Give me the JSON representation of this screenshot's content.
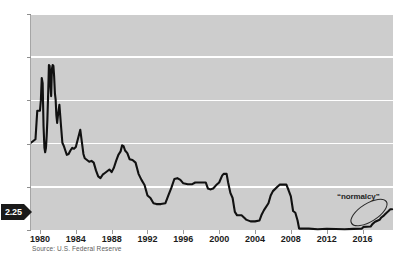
{
  "chart_data": {
    "type": "line",
    "title": "",
    "subtitle": "",
    "xlabel": "",
    "ylabel": "",
    "xlim": [
      1979.0,
      2019.4
    ],
    "ylim": [
      0,
      25
    ],
    "grid": true,
    "grid_axis": "y",
    "legend": "none",
    "series_name": "Federal funds rate",
    "series_color": "#111111",
    "plot_background": "#cdcdcd",
    "gridline_color": "#ffffff",
    "x_ticks": [
      1980,
      1984,
      1988,
      1992,
      1996,
      2000,
      2004,
      2008,
      2012,
      2016
    ],
    "x_tick_labels": [
      "1980",
      "1984",
      "1988",
      "1992",
      "1996",
      "2000",
      "2004",
      "2008",
      "2012",
      "2016"
    ],
    "y_ticks": [
      0,
      5,
      10,
      15,
      20,
      25
    ],
    "y_tick_labels": [
      "0",
      "5",
      "10",
      "15",
      "20",
      "25"
    ],
    "x": [
      1979.0,
      1979.25,
      1979.5,
      1979.7,
      1979.85,
      1980.0,
      1980.1,
      1980.2,
      1980.3,
      1980.4,
      1980.5,
      1980.58,
      1980.67,
      1980.75,
      1980.83,
      1980.92,
      1981.0,
      1981.08,
      1981.17,
      1981.25,
      1981.33,
      1981.42,
      1981.5,
      1981.58,
      1981.67,
      1981.75,
      1981.83,
      1981.92,
      1982.0,
      1982.17,
      1982.33,
      1982.5,
      1982.67,
      1982.83,
      1983.0,
      1983.2,
      1983.4,
      1983.6,
      1983.8,
      1984.0,
      1984.25,
      1984.5,
      1984.7,
      1984.85,
      1985.0,
      1985.25,
      1985.5,
      1985.75,
      1986.0,
      1986.25,
      1986.5,
      1986.75,
      1987.0,
      1987.25,
      1987.5,
      1987.75,
      1988.0,
      1988.25,
      1988.5,
      1988.75,
      1989.0,
      1989.17,
      1989.33,
      1989.5,
      1989.75,
      1990.0,
      1990.33,
      1990.67,
      1991.0,
      1991.33,
      1991.67,
      1992.0,
      1992.33,
      1992.67,
      1993.0,
      1993.5,
      1994.0,
      1994.33,
      1994.67,
      1995.0,
      1995.33,
      1995.67,
      1996.0,
      1996.5,
      1997.0,
      1997.33,
      1997.67,
      1998.0,
      1998.5,
      1998.75,
      1999.0,
      1999.33,
      1999.67,
      2000.0,
      2000.33,
      2000.5,
      2000.83,
      2001.0,
      2001.25,
      2001.5,
      2001.75,
      2002.0,
      2002.5,
      2002.92,
      2003.0,
      2003.5,
      2003.75,
      2004.0,
      2004.5,
      2004.75,
      2005.0,
      2005.5,
      2005.75,
      2006.0,
      2006.5,
      2006.75,
      2007.0,
      2007.5,
      2007.75,
      2008.0,
      2008.25,
      2008.5,
      2008.75,
      2008.92,
      2009.0,
      2010.0,
      2011.0,
      2012.0,
      2013.0,
      2014.0,
      2015.0,
      2015.9,
      2016.1,
      2016.9,
      2017.1,
      2017.4,
      2017.6,
      2017.9,
      2018.1,
      2018.4,
      2018.6,
      2018.9,
      2019.1,
      2019.3
    ],
    "y": [
      10.1,
      10.3,
      10.5,
      13.8,
      13.8,
      13.8,
      15.0,
      17.6,
      17.0,
      12.0,
      9.5,
      9.0,
      9.5,
      10.9,
      12.8,
      15.9,
      19.1,
      19.0,
      16.6,
      15.5,
      18.6,
      19.1,
      19.0,
      17.8,
      15.8,
      15.1,
      13.3,
      12.4,
      13.2,
      14.5,
      12.3,
      10.1,
      9.7,
      9.2,
      8.7,
      8.8,
      9.2,
      9.5,
      9.4,
      9.6,
      10.6,
      11.6,
      10.0,
      8.8,
      8.3,
      8.1,
      7.9,
      8.0,
      7.8,
      6.9,
      6.2,
      6.0,
      6.4,
      6.6,
      6.8,
      7.0,
      6.7,
      7.2,
      8.0,
      8.7,
      9.1,
      9.8,
      9.7,
      9.2,
      8.9,
      8.2,
      8.1,
      7.8,
      6.5,
      5.8,
      5.2,
      4.0,
      3.7,
      3.1,
      3.0,
      3.0,
      3.1,
      4.0,
      4.9,
      5.9,
      6.0,
      5.8,
      5.4,
      5.3,
      5.3,
      5.5,
      5.5,
      5.5,
      5.5,
      4.8,
      4.7,
      4.8,
      5.2,
      5.5,
      6.3,
      6.5,
      6.5,
      5.5,
      4.3,
      3.7,
      2.1,
      1.7,
      1.7,
      1.3,
      1.2,
      1.0,
      1.0,
      1.0,
      1.1,
      1.8,
      2.3,
      3.1,
      4.0,
      4.5,
      5.0,
      5.25,
      5.25,
      5.25,
      4.6,
      3.9,
      2.2,
      2.0,
      1.1,
      0.18,
      0.16,
      0.16,
      0.09,
      0.14,
      0.11,
      0.09,
      0.13,
      0.15,
      0.36,
      0.4,
      0.68,
      0.95,
      1.05,
      1.18,
      1.45,
      1.7,
      1.92,
      2.2,
      2.4,
      2.4
    ],
    "annotations": [
      {
        "name": "normalcy-label",
        "text": "“normalcy”",
        "x": 2016.2,
        "y": 4.0,
        "shape": "ellipse-around-endpoint"
      },
      {
        "name": "current-value-badge",
        "text": "2.25",
        "y": 2.25,
        "style": "black-arrow-callout-left-axis"
      }
    ],
    "source": "Source: U.S. Federal Reserve"
  },
  "callout": {
    "value_label": "2.25"
  },
  "annotation": {
    "normalcy_label": "“normalcy”"
  },
  "footer": {
    "source": "Source: U.S. Federal Reserve"
  }
}
